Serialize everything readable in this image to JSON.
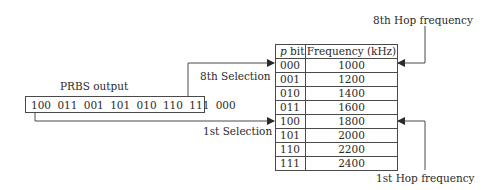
{
  "diagram": {
    "prbs": {
      "label": "PRBS output",
      "bits": "100 011 001 101 010 110 111 000"
    },
    "selections": {
      "eighth": "8th Selection",
      "first": "1st Selection"
    },
    "hops": {
      "eighth": "8th Hop frequency",
      "first": "1st Hop frequency"
    },
    "table": {
      "headers": {
        "pbit_italic": "p",
        "pbit_rest": " bit",
        "frequency": "Frequency (kHz)"
      },
      "rows": [
        {
          "pbit": "000",
          "freq": "1000"
        },
        {
          "pbit": "001",
          "freq": "1200"
        },
        {
          "pbit": "010",
          "freq": "1400"
        },
        {
          "pbit": "011",
          "freq": "1600"
        },
        {
          "pbit": "100",
          "freq": "1800"
        },
        {
          "pbit": "101",
          "freq": "2000"
        },
        {
          "pbit": "110",
          "freq": "2200"
        },
        {
          "pbit": "111",
          "freq": "2400"
        }
      ]
    },
    "colors": {
      "line": "#4a4a4a",
      "text": "#2a2a2a",
      "background": "#ffffff"
    }
  }
}
